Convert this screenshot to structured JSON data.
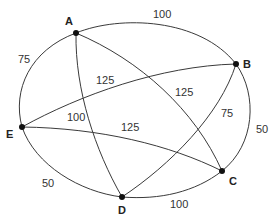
{
  "graph": {
    "nodes": [
      {
        "id": "A",
        "label": "A",
        "x": 76,
        "y": 33
      },
      {
        "id": "B",
        "label": "B",
        "x": 236,
        "y": 64
      },
      {
        "id": "C",
        "label": "C",
        "x": 222,
        "y": 171
      },
      {
        "id": "D",
        "label": "D",
        "x": 122,
        "y": 197
      },
      {
        "id": "E",
        "label": "E",
        "x": 22,
        "y": 127
      }
    ],
    "edges": [
      {
        "from": "A",
        "to": "B",
        "weight": "100"
      },
      {
        "from": "B",
        "to": "C",
        "weight": "50"
      },
      {
        "from": "C",
        "to": "D",
        "weight": "100"
      },
      {
        "from": "D",
        "to": "E",
        "weight": "50"
      },
      {
        "from": "E",
        "to": "A",
        "weight": "75"
      },
      {
        "from": "A",
        "to": "C",
        "weight": "125"
      },
      {
        "from": "A",
        "to": "D",
        "weight": "100"
      },
      {
        "from": "B",
        "to": "E",
        "weight": "125"
      },
      {
        "from": "B",
        "to": "D",
        "weight": "75"
      },
      {
        "from": "E",
        "to": "C",
        "weight": "125"
      }
    ]
  },
  "labels": {
    "A": "A",
    "B": "B",
    "C": "C",
    "D": "D",
    "E": "E",
    "w_AB": "100",
    "w_BC": "50",
    "w_CD": "100",
    "w_DE": "50",
    "w_EA": "75",
    "w_AC": "125",
    "w_AD": "100",
    "w_BE": "125",
    "w_BD": "75",
    "w_EC": "125"
  }
}
